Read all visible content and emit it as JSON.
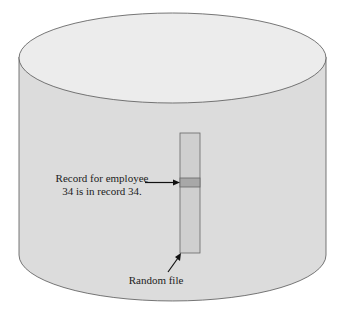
{
  "diagram": {
    "type": "random-access-file-cylinder",
    "record_label_line1": "Record for employee",
    "record_label_line2": "34 is in record 34.",
    "file_label": "Random file",
    "colors": {
      "background": "#ffffff",
      "cylinder_side": "#dcdcdc",
      "cylinder_top": "#ececec",
      "outline": "#555555",
      "file_fill": "#cfcfcf",
      "record_highlight": "#a8a8a8",
      "text": "#222222"
    }
  }
}
